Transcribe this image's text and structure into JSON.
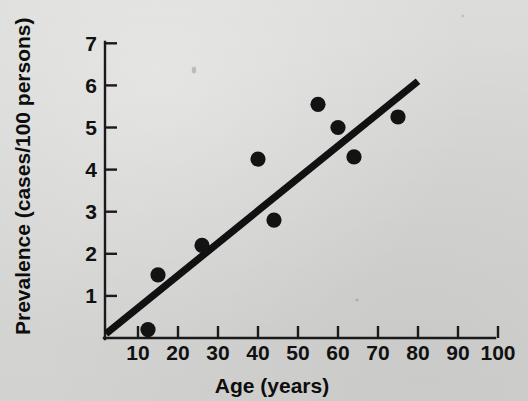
{
  "figure": {
    "name": "prevalence-vs-age-scatter",
    "background_color": "#d9d9d7",
    "ink_color": "#131313"
  },
  "chart_data": {
    "type": "scatter",
    "title": "",
    "subtitle": "",
    "xlabel": "Age (years)",
    "ylabel": "Prevalence (cases/100 persons)",
    "xlim": [
      0,
      105
    ],
    "ylim": [
      0,
      7.4
    ],
    "xticks": [
      10,
      20,
      30,
      40,
      50,
      60,
      70,
      80,
      90,
      100
    ],
    "xtick_labels": [
      "10",
      "20",
      "30",
      "40",
      "50",
      "60",
      "70",
      "80",
      "90",
      "100"
    ],
    "yticks": [
      1,
      2,
      3,
      4,
      5,
      6,
      7
    ],
    "ytick_labels": [
      "1",
      "2",
      "3",
      "4",
      "5",
      "6",
      "7"
    ],
    "grid": false,
    "legend": null,
    "legend_position": "none",
    "series": [
      {
        "name": "Observed prevalence",
        "marker": "filled-circle",
        "color": "#131313",
        "points": [
          {
            "x": 12.5,
            "y": 0.2
          },
          {
            "x": 15.0,
            "y": 1.5
          },
          {
            "x": 26.0,
            "y": 2.2
          },
          {
            "x": 40.0,
            "y": 4.25
          },
          {
            "x": 44.0,
            "y": 2.8
          },
          {
            "x": 55.0,
            "y": 5.55
          },
          {
            "x": 60.0,
            "y": 5.0
          },
          {
            "x": 64.0,
            "y": 4.3
          },
          {
            "x": 75.0,
            "y": 5.25
          }
        ]
      }
    ],
    "trend_line": {
      "name": "Fitted regression line",
      "color": "#111111",
      "x_start": 2.0,
      "y_start": 0.1,
      "x_end": 80.0,
      "y_end": 6.1
    },
    "annotations": []
  }
}
